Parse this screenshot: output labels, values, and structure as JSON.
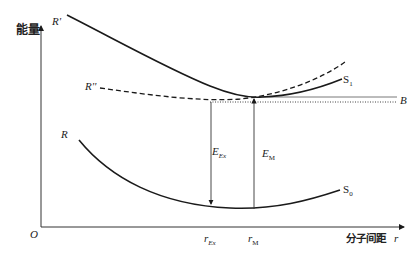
{
  "axes": {
    "y_label": "能量",
    "x_label": "分子间距",
    "x_label_symbol": "r",
    "origin": "O"
  },
  "curves": {
    "R_prime": {
      "label": "R'",
      "end_label": "S",
      "end_sub": "1",
      "style": "solid"
    },
    "R_double_prime": {
      "label": "R''",
      "style": "dashed"
    },
    "R": {
      "label": "R",
      "end_label": "S",
      "end_sub": "0",
      "style": "solid"
    },
    "B": {
      "label": "B",
      "style": "dotted-double"
    }
  },
  "annotations": {
    "E_Ex": {
      "main": "E",
      "sub": "Ex"
    },
    "E_M": {
      "main": "E",
      "sub": "M"
    },
    "r_Ex": {
      "main": "r",
      "sub": "Ex"
    },
    "r_M": {
      "main": "r",
      "sub": "M"
    }
  },
  "colors": {
    "line": "#1a1a1a",
    "text": "#222222",
    "background": "#ffffff"
  }
}
